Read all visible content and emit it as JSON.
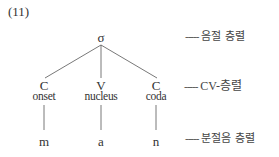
{
  "example_number": "(11)",
  "tree": {
    "root": "σ",
    "cv_nodes": [
      {
        "symbol": "C",
        "role": "onset",
        "segment": "m"
      },
      {
        "symbol": "V",
        "role": "nucleus",
        "segment": "a"
      },
      {
        "symbol": "C",
        "role": "coda",
        "segment": "n"
      }
    ]
  },
  "tiers": {
    "syllable": {
      "dash": "-----",
      "label": "음절 층렬"
    },
    "cv": {
      "dash": "-----",
      "label": "CV-층렬"
    },
    "segment": {
      "dash": "-----",
      "label": "분절음 층렬"
    }
  },
  "colors": {
    "line": "#555555",
    "text": "#333333"
  }
}
